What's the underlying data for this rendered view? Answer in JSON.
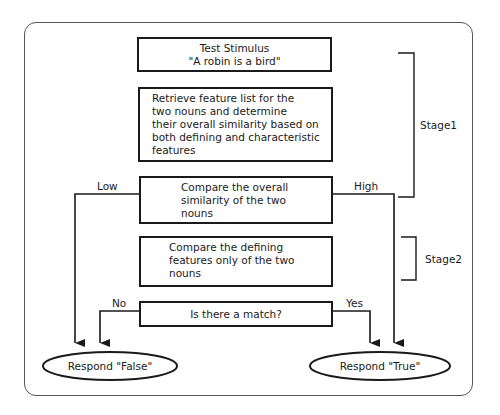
{
  "diagram": {
    "nodes": {
      "stimulus": {
        "line1": "Test Stimulus",
        "line2": "\"A robin is a bird\""
      },
      "retrieve": {
        "text": "Retrieve feature list for the\ntwo nouns and determine\ntheir  overall  similarity  based on\nboth defining and characteristic\nfeatures"
      },
      "compare_overall": {
        "text": "Compare the overall\nsimilarity of the two\nnouns"
      },
      "compare_defining": {
        "text": "Compare the defining\nfeatures only of the two\nnouns"
      },
      "match": {
        "text": "Is there a match?"
      },
      "respond_false": {
        "text": "Respond \"False\""
      },
      "respond_true": {
        "text": "Respond \"True\""
      }
    },
    "edges": {
      "low": "Low",
      "high": "High",
      "no": "No",
      "yes": "Yes"
    },
    "stages": {
      "stage1": "Stage1",
      "stage2": "Stage2"
    },
    "colors": {
      "line": "#1a1a1a",
      "frame": "#555555",
      "background": "#ffffff"
    }
  }
}
